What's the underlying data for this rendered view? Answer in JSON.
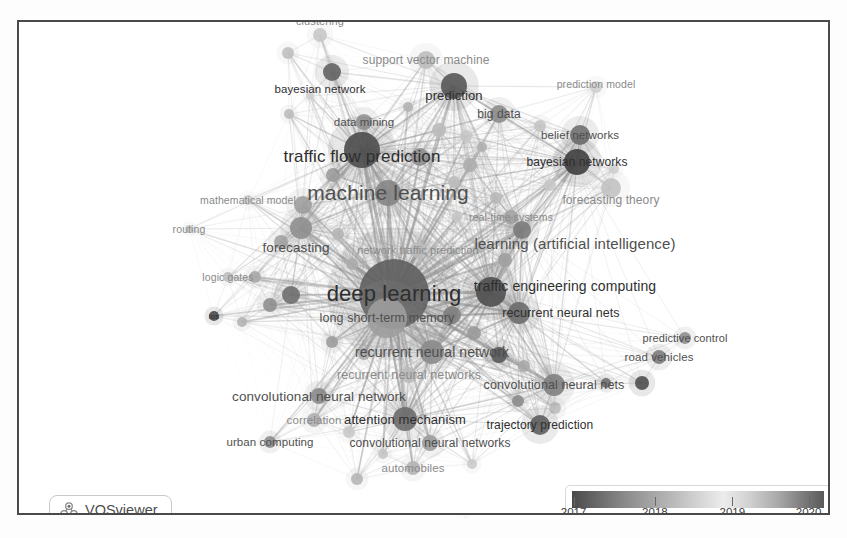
{
  "app": {
    "name": "VOSviewer",
    "badge_label": "VOSviewer",
    "logo_icon": "vosviewer-logo-icon"
  },
  "legend": {
    "title": "average publication year",
    "ticks": [
      {
        "label": "2017",
        "pos": 0.03
      },
      {
        "label": "2018",
        "pos": 0.35
      },
      {
        "label": "2019",
        "pos": 0.655
      },
      {
        "label": "2020",
        "pos": 0.955
      }
    ],
    "gradient_stops": [
      "#4a4a4a",
      "#8d8d8d",
      "#d8d8d8",
      "#ececec",
      "#a8a8a8",
      "#5a5a5a"
    ],
    "min_year": 2017,
    "max_year": 2020
  },
  "chart_data": {
    "type": "network",
    "title": "",
    "colorbar": {
      "label": "year",
      "min": 2017,
      "max": 2020
    },
    "nodes": [
      {
        "id": "clustering",
        "label": "clustering",
        "x": 318,
        "y": 33,
        "r": 7,
        "year": 2018.8,
        "font": 11,
        "label_dx": 0,
        "label_dy": -14,
        "shade": "#c8c8c8"
      },
      {
        "id": "support-vector-machine",
        "label": "support vector machine",
        "x": 424,
        "y": 58,
        "r": 9,
        "year": 2018.9,
        "font": 12,
        "label_dx": 0,
        "label_dy": 0,
        "shade": "#bdbdbd"
      },
      {
        "id": "bayesian-network",
        "label": "bayesian network",
        "x": 330,
        "y": 70,
        "r": 9,
        "year": 2017.6,
        "font": 11.5,
        "label_dx": -12,
        "label_dy": 17,
        "shade": "#636363"
      },
      {
        "id": "prediction",
        "label": "prediction",
        "x": 452,
        "y": 84,
        "r": 13,
        "year": 2017.7,
        "font": 13,
        "label_dx": 0,
        "label_dy": 9,
        "shade": "#575757"
      },
      {
        "id": "prediction-model",
        "label": "prediction model",
        "x": 594,
        "y": 85,
        "r": 6,
        "year": 2019.0,
        "font": 10.5,
        "label_dx": 0,
        "label_dy": -3,
        "shade": "#cfcfcf"
      },
      {
        "id": "data-mining",
        "label": "data mining",
        "x": 362,
        "y": 120,
        "r": 8,
        "year": 2017.9,
        "font": 11.5,
        "label_dx": 0,
        "label_dy": 0,
        "shade": "#9a9a9a"
      },
      {
        "id": "big-data",
        "label": "big data",
        "x": 497,
        "y": 112,
        "r": 9,
        "year": 2017.8,
        "font": 12,
        "label_dx": 0,
        "label_dy": 0,
        "shade": "#8c8c8c"
      },
      {
        "id": "belief-networks",
        "label": "belief networks",
        "x": 578,
        "y": 133,
        "r": 10,
        "year": 2017.8,
        "font": 11.5,
        "label_dx": 0,
        "label_dy": 0,
        "shade": "#707070"
      },
      {
        "id": "bayesian-networks",
        "label": "bayesian networks",
        "x": 575,
        "y": 160,
        "r": 13,
        "year": 2017.4,
        "font": 12,
        "label_dx": 0,
        "label_dy": 0,
        "shade": "#3f3f3f"
      },
      {
        "id": "traffic-flow-prediction",
        "label": "traffic flow prediction",
        "x": 360,
        "y": 148,
        "r": 18,
        "year": 2017.6,
        "font": 17,
        "label_dx": 0,
        "label_dy": 7,
        "shade": "#4d4d4d"
      },
      {
        "id": "machine-learning",
        "label": "machine learning",
        "x": 386,
        "y": 191,
        "r": 13,
        "year": 2018.3,
        "font": 21,
        "label_dx": 0,
        "label_dy": 0,
        "shade": "#858585"
      },
      {
        "id": "mathematical-model",
        "label": "mathematical model",
        "x": 246,
        "y": 198,
        "r": 5,
        "year": 2019.1,
        "font": 10.5,
        "label_dx": 0,
        "label_dy": 0,
        "shade": "#d0d0d0"
      },
      {
        "id": "forecasting-theory",
        "label": "forecasting theory",
        "x": 609,
        "y": 186,
        "r": 10,
        "year": 2019.3,
        "font": 12,
        "label_dx": 0,
        "label_dy": 12,
        "shade": "#c2c2c2"
      },
      {
        "id": "real-time-systems",
        "label": "real-time systems",
        "x": 509,
        "y": 215,
        "r": 7,
        "year": 2018.6,
        "font": 10.5,
        "label_dx": 0,
        "label_dy": 0,
        "shade": "#a5a5a5"
      },
      {
        "id": "routing",
        "label": "routing",
        "x": 187,
        "y": 227,
        "r": 4,
        "year": 2019.0,
        "font": 10.5,
        "label_dx": 0,
        "label_dy": 0,
        "shade": "#cdcdcd"
      },
      {
        "id": "forecasting",
        "label": "forecasting",
        "x": 299,
        "y": 226,
        "r": 11,
        "year": 2018.4,
        "font": 13.5,
        "label_dx": -5,
        "label_dy": 19,
        "shade": "#8f8f8f"
      },
      {
        "id": "network-traffic-prediction",
        "label": "network traffic prediction",
        "x": 416,
        "y": 248,
        "r": 8,
        "year": 2019.4,
        "font": 11,
        "label_dx": 0,
        "label_dy": 0,
        "shade": "#cacaca"
      },
      {
        "id": "learning-artificial-intelligence",
        "label": "learning (artificial intelligence)",
        "x": 520,
        "y": 228,
        "r": 9,
        "year": 2018.9,
        "font": 15,
        "label_dx": 53,
        "label_dy": 13,
        "shade": "#7b7b7b"
      },
      {
        "id": "logic-gates",
        "label": "logic gates",
        "x": 226,
        "y": 275,
        "r": 5,
        "year": 2018.9,
        "font": 10.5,
        "label_dx": 0,
        "label_dy": 0,
        "shade": "#bdbdbd"
      },
      {
        "id": "deep-learning",
        "label": "deep learning",
        "x": 392,
        "y": 292,
        "r": 35,
        "year": 2018.9,
        "font": 22,
        "label_dx": 0,
        "label_dy": 0,
        "shade": "#5f5f5f"
      },
      {
        "id": "traffic-engineering-computing",
        "label": "traffic engineering computing",
        "x": 489,
        "y": 290,
        "r": 15,
        "year": 2018.4,
        "font": 14,
        "label_dx": 74,
        "label_dy": -6,
        "shade": "#4f4f4f"
      },
      {
        "id": "ios",
        "label": "ios",
        "x": 212,
        "y": 314,
        "r": 5,
        "year": 2017.9,
        "font": 8,
        "label_dx": 0,
        "label_dy": 0,
        "shade": "#4a4a4a"
      },
      {
        "id": "long-short-term-memory",
        "label": "long short-term memory",
        "x": 385,
        "y": 316,
        "r": 20,
        "year": 2019.2,
        "font": 12.5,
        "label_dx": 0,
        "label_dy": 0,
        "shade": "#9d9d9d"
      },
      {
        "id": "recurrent-neural-nets",
        "label": "recurrent neural nets",
        "x": 517,
        "y": 311,
        "r": 11,
        "year": 2018.3,
        "font": 12.5,
        "label_dx": 42,
        "label_dy": 0,
        "shade": "#6c6c6c"
      },
      {
        "id": "predictive-control",
        "label": "predictive control",
        "x": 683,
        "y": 336,
        "r": 6,
        "year": 2018.7,
        "font": 11,
        "label_dx": 0,
        "label_dy": 0,
        "shade": "#8e8e8e"
      },
      {
        "id": "recurrent-neural-network",
        "label": "recurrent neural network",
        "x": 430,
        "y": 350,
        "r": 12,
        "year": 2018.9,
        "font": 14,
        "label_dx": 0,
        "label_dy": 0,
        "shade": "#8b8b8b"
      },
      {
        "id": "road-vehicles",
        "label": "road vehicles",
        "x": 657,
        "y": 355,
        "r": 7,
        "year": 2018.1,
        "font": 11.5,
        "label_dx": 0,
        "label_dy": 0,
        "shade": "#7c7c7c"
      },
      {
        "id": "recurrent-neural-networks",
        "label": "recurrent neural networks",
        "x": 407,
        "y": 373,
        "r": 8,
        "year": 2019.2,
        "font": 12.5,
        "label_dx": 0,
        "label_dy": 0,
        "shade": "#b9b9b9"
      },
      {
        "id": "convolutional-neural-nets",
        "label": "convolutional neural nets",
        "x": 552,
        "y": 383,
        "r": 11,
        "year": 2018.3,
        "font": 12.5,
        "label_dx": 0,
        "label_dy": 0,
        "shade": "#7f7f7f"
      },
      {
        "id": "convolutional-neural-network",
        "label": "convolutional neural network",
        "x": 317,
        "y": 394,
        "r": 8,
        "year": 2018.6,
        "font": 13.5,
        "label_dx": 0,
        "label_dy": 0,
        "shade": "#8a8a8a"
      },
      {
        "id": "attention-mechanism",
        "label": "attention mechanism",
        "x": 403,
        "y": 417,
        "r": 12,
        "year": 2019.5,
        "font": 13,
        "label_dx": 0,
        "label_dy": 0,
        "shade": "#6b6b6b"
      },
      {
        "id": "correlation",
        "label": "correlation",
        "x": 312,
        "y": 418,
        "r": 7,
        "year": 2019.1,
        "font": 11.5,
        "label_dx": 0,
        "label_dy": 0,
        "shade": "#b0b0b0"
      },
      {
        "id": "trajectory-prediction",
        "label": "trajectory prediction",
        "x": 538,
        "y": 423,
        "r": 10,
        "year": 2019.6,
        "font": 12,
        "label_dx": 0,
        "label_dy": 0,
        "shade": "#5e5e5e"
      },
      {
        "id": "urban-computing",
        "label": "urban computing",
        "x": 268,
        "y": 440,
        "r": 6,
        "year": 2018.7,
        "font": 11.5,
        "label_dx": 0,
        "label_dy": 0,
        "shade": "#8d8d8d"
      },
      {
        "id": "convolutional-neural-networks",
        "label": "convolutional neural networks",
        "x": 428,
        "y": 441,
        "r": 8,
        "year": 2019.3,
        "font": 12,
        "label_dx": 0,
        "label_dy": 0,
        "shade": "#9c9c9c"
      },
      {
        "id": "automobiles",
        "label": "automobiles",
        "x": 411,
        "y": 466,
        "r": 7,
        "year": 2019.0,
        "font": 11.5,
        "label_dx": 0,
        "label_dy": 0,
        "shade": "#b4b4b4"
      }
    ],
    "unlabeled_nodes": [
      {
        "x": 286,
        "y": 51,
        "r": 6,
        "shade": "#bfbfbf"
      },
      {
        "x": 287,
        "y": 112,
        "r": 5,
        "shade": "#bdbdbd"
      },
      {
        "x": 308,
        "y": 94,
        "r": 4,
        "shade": "#cfcfcf"
      },
      {
        "x": 406,
        "y": 105,
        "r": 5,
        "shade": "#b2b2b2"
      },
      {
        "x": 437,
        "y": 128,
        "r": 7,
        "shade": "#bbbbbb"
      },
      {
        "x": 464,
        "y": 134,
        "r": 6,
        "shade": "#c6c6c6"
      },
      {
        "x": 480,
        "y": 145,
        "r": 5,
        "shade": "#b0b0b0"
      },
      {
        "x": 538,
        "y": 124,
        "r": 6,
        "shade": "#c4c4c4"
      },
      {
        "x": 548,
        "y": 183,
        "r": 6,
        "shade": "#c8c8c8"
      },
      {
        "x": 612,
        "y": 167,
        "r": 5,
        "shade": "#d0d0d0"
      },
      {
        "x": 418,
        "y": 155,
        "r": 9,
        "shade": "#8c8c8c"
      },
      {
        "x": 468,
        "y": 163,
        "r": 7,
        "shade": "#adadad"
      },
      {
        "x": 331,
        "y": 173,
        "r": 7,
        "shade": "#9b9b9b"
      },
      {
        "x": 301,
        "y": 203,
        "r": 9,
        "shade": "#9f9f9f"
      },
      {
        "x": 452,
        "y": 180,
        "r": 6,
        "shade": "#bcbcbc"
      },
      {
        "x": 494,
        "y": 196,
        "r": 6,
        "shade": "#b8b8b8"
      },
      {
        "x": 279,
        "y": 240,
        "r": 7,
        "shade": "#a3a3a3"
      },
      {
        "x": 253,
        "y": 275,
        "r": 6,
        "shade": "#a9a9a9"
      },
      {
        "x": 336,
        "y": 232,
        "r": 6,
        "shade": "#b5b5b5"
      },
      {
        "x": 455,
        "y": 215,
        "r": 5,
        "shade": "#c5c5c5"
      },
      {
        "x": 478,
        "y": 245,
        "r": 6,
        "shade": "#b6b6b6"
      },
      {
        "x": 503,
        "y": 258,
        "r": 7,
        "shade": "#a0a0a0"
      },
      {
        "x": 268,
        "y": 303,
        "r": 7,
        "shade": "#8f8f8f"
      },
      {
        "x": 289,
        "y": 293,
        "r": 9,
        "shade": "#6f6f6f"
      },
      {
        "x": 450,
        "y": 313,
        "r": 9,
        "shade": "#828282"
      },
      {
        "x": 472,
        "y": 331,
        "r": 7,
        "shade": "#9a9a9a"
      },
      {
        "x": 330,
        "y": 340,
        "r": 6,
        "shade": "#9c9c9c"
      },
      {
        "x": 362,
        "y": 352,
        "r": 6,
        "shade": "#aaaaaa"
      },
      {
        "x": 497,
        "y": 353,
        "r": 8,
        "shade": "#565656"
      },
      {
        "x": 522,
        "y": 364,
        "r": 6,
        "shade": "#a7a7a7"
      },
      {
        "x": 604,
        "y": 381,
        "r": 5,
        "shade": "#6e6e6e"
      },
      {
        "x": 640,
        "y": 381,
        "r": 7,
        "shade": "#4f4f4f"
      },
      {
        "x": 553,
        "y": 406,
        "r": 6,
        "shade": "#bdbdbd"
      },
      {
        "x": 516,
        "y": 399,
        "r": 6,
        "shade": "#8b8b8b"
      },
      {
        "x": 347,
        "y": 430,
        "r": 6,
        "shade": "#c9c9c9"
      },
      {
        "x": 381,
        "y": 452,
        "r": 5,
        "shade": "#c5c5c5"
      },
      {
        "x": 355,
        "y": 477,
        "r": 6,
        "shade": "#b6b6b6"
      },
      {
        "x": 470,
        "y": 462,
        "r": 5,
        "shade": "#cbcbcb"
      },
      {
        "x": 240,
        "y": 320,
        "r": 5,
        "shade": "#b4b4b4"
      },
      {
        "x": 350,
        "y": 262,
        "r": 6,
        "shade": "#b8b8b8"
      }
    ]
  }
}
